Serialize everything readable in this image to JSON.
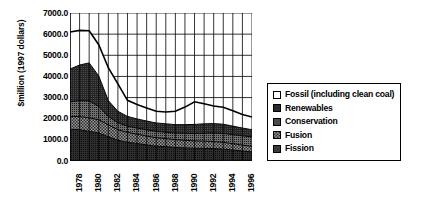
{
  "chart_data": {
    "type": "area",
    "title": "",
    "subtitle": "",
    "xlabel": "",
    "ylabel": "$million (1997 dollars)",
    "ylim": [
      0,
      7000
    ],
    "ytick_step": 1000,
    "ytick_labels": [
      "7000.0",
      "6000.0",
      "5000.0",
      "4000.0",
      "3000.0",
      "2000.0",
      "1000.0",
      "0.0"
    ],
    "ytick_values": [
      7000,
      6000,
      5000,
      4000,
      3000,
      2000,
      1000,
      0
    ],
    "grid": "vertical-and-horizontal",
    "legend_position": "right",
    "stacked": true,
    "stack_order_bottom_to_top": [
      "Fission",
      "Fusion",
      "Conservation",
      "Renewables",
      "Fossil (including clean coal)"
    ],
    "x": [
      1978,
      1979,
      1980,
      1981,
      1982,
      1983,
      1984,
      1985,
      1986,
      1987,
      1988,
      1989,
      1990,
      1991,
      1992,
      1993,
      1994,
      1995,
      1996,
      1997
    ],
    "xtick_labels": [
      "1978",
      "1980",
      "1982",
      "1984",
      "1986",
      "1988",
      "1990",
      "1992",
      "1994",
      "1996"
    ],
    "xtick_values": [
      1978,
      1980,
      1982,
      1984,
      1986,
      1988,
      1990,
      1992,
      1994,
      1996
    ],
    "series": [
      {
        "name": "Fission",
        "color": "#3a3a3a",
        "pattern": "solid-dark",
        "values": [
          1500,
          1480,
          1400,
          1330,
          1150,
          980,
          880,
          830,
          760,
          700,
          680,
          640,
          620,
          600,
          600,
          590,
          560,
          520,
          470,
          430
        ]
      },
      {
        "name": "Fusion",
        "color": "#8a8a8a",
        "pattern": "checker",
        "values": [
          600,
          620,
          640,
          620,
          560,
          500,
          470,
          440,
          420,
          400,
          380,
          370,
          360,
          350,
          340,
          330,
          320,
          300,
          280,
          260
        ]
      },
      {
        "name": "Conservation",
        "color": "#4a4a4a",
        "pattern": "solid-medium",
        "values": [
          700,
          760,
          800,
          640,
          400,
          330,
          300,
          290,
          290,
          300,
          300,
          310,
          330,
          350,
          370,
          400,
          420,
          430,
          440,
          450
        ]
      },
      {
        "name": "Renewables",
        "color": "#2b2b2b",
        "pattern": "solid-dark",
        "values": [
          1550,
          1680,
          1800,
          1430,
          750,
          540,
          460,
          430,
          420,
          400,
          400,
          400,
          410,
          430,
          450,
          450,
          440,
          400,
          370,
          340
        ]
      },
      {
        "name": "Fossil (including clean coal)",
        "color": "#ffffff",
        "pattern": "open",
        "values": [
          1750,
          1640,
          1520,
          1480,
          1550,
          1300,
          760,
          680,
          620,
          550,
          560,
          630,
          830,
          1070,
          950,
          830,
          800,
          730,
          640,
          600
        ]
      }
    ],
    "totals": [
      6100,
      6180,
      6160,
      5500,
      4410,
      3650,
      2870,
      2670,
      2510,
      2350,
      2320,
      2350,
      2550,
      2800,
      2710,
      2600,
      2540,
      2380,
      2200,
      2080
    ]
  },
  "legend": {
    "items": [
      {
        "label": "Fossil (including clean coal)",
        "swatch": "open-square-swatch"
      },
      {
        "label": "Renewables",
        "swatch": "dark-square-swatch"
      },
      {
        "label": "Conservation",
        "swatch": "medium-square-swatch"
      },
      {
        "label": "Fusion",
        "swatch": "checker-square-swatch"
      },
      {
        "label": "Fission",
        "swatch": "dark-square-swatch"
      }
    ]
  },
  "axes": {
    "y_title": "$million (1997 dollars)"
  }
}
